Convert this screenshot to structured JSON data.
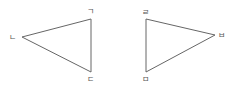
{
  "diagram": {
    "type": "two-triangles",
    "line_color": "#666666",
    "label_color": "#555555",
    "triangles": [
      {
        "name": "left-triangle",
        "vertices": [
          {
            "label": "ㄱ",
            "x": 91,
            "y": 19,
            "lx": 87,
            "ly": 14
          },
          {
            "label": "ㄴ",
            "x": 22,
            "y": 37,
            "lx": 9,
            "ly": 40
          },
          {
            "label": "ㄷ",
            "x": 91,
            "y": 72,
            "lx": 87,
            "ly": 82
          }
        ]
      },
      {
        "name": "right-triangle",
        "vertices": [
          {
            "label": "ㄹ",
            "x": 146,
            "y": 19,
            "lx": 142,
            "ly": 15
          },
          {
            "label": "ㅂ",
            "x": 215,
            "y": 35,
            "lx": 218,
            "ly": 38
          },
          {
            "label": "ㅁ",
            "x": 146,
            "y": 72,
            "lx": 142,
            "ly": 82
          }
        ]
      }
    ]
  }
}
